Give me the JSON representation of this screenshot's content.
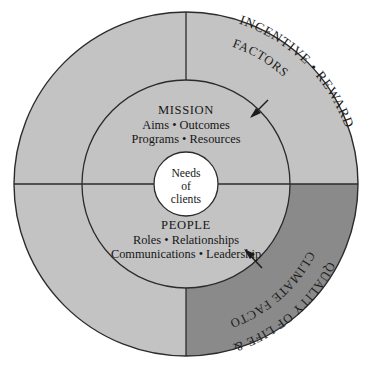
{
  "diagram": {
    "colors": {
      "outer_ring_light": "#c3c3c3",
      "outer_ring_dark": "#8a8a8a",
      "middle_ring": "#c3c3c3",
      "core": "#ffffff",
      "stroke": "#2b2b2b",
      "text": "#161616",
      "background": "#ffffff"
    },
    "core": {
      "name": "core-circle",
      "lines": [
        "Needs",
        "of",
        "clients"
      ]
    },
    "sectors": {
      "top": {
        "name": "mission-sector",
        "heading": "MISSION",
        "lines": [
          "Aims  •  Outcomes",
          "Programs  •  Resources"
        ]
      },
      "bottom": {
        "name": "people-sector",
        "heading": "PEOPLE",
        "lines": [
          "Roles  •  Relationships",
          "Communications  •  Leadership"
        ]
      }
    },
    "outer_ring_labels": {
      "upper_right": {
        "name": "incentive-reward-factors-label",
        "outer_text": "INCENTIVE • REWARD",
        "inner_text": "FACTORS"
      },
      "lower_right": {
        "name": "quality-of-life-climate-factors-label",
        "outer_text": "QUALITY OF LIFE &",
        "inner_text": "CLIMATE FACTORS"
      }
    },
    "arrows": [
      {
        "name": "incentive-reward-arrow",
        "points_to": "mission-sector"
      },
      {
        "name": "quality-of-life-arrow",
        "points_to": "people-sector"
      }
    ],
    "geometry": {
      "center_x": 186,
      "center_y": 184,
      "outer_radius": 172,
      "middle_radius": 104,
      "core_radius": 32
    }
  }
}
